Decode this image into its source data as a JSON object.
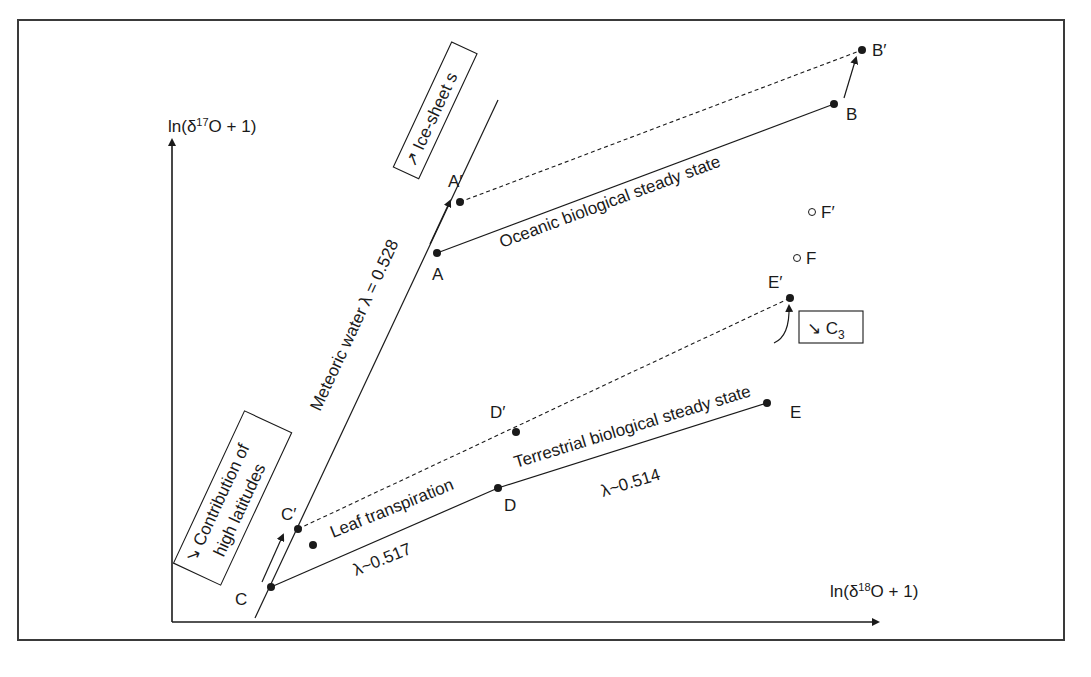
{
  "axes": {
    "y_label": "ln(δ17O + 1)",
    "y_label_parts": {
      "prefix": "ln(δ",
      "sup": "17",
      "suffix": "O + 1)"
    },
    "x_label": "ln(δ18O + 1)",
    "x_label_parts": {
      "prefix": "ln(δ",
      "sup": "18",
      "suffix": "O + 1)"
    }
  },
  "points": {
    "A": "A",
    "A_prime": "A′",
    "B": "B",
    "B_prime": "B′",
    "C": "C",
    "C_prime": "C′",
    "D": "D",
    "D_prime": "D′",
    "E": "E",
    "E_prime": "E′",
    "F": "F",
    "F_prime": "F′"
  },
  "lines": {
    "meteoric_water": "Meteoric water λ = 0.528",
    "oceanic": "Oceanic biological steady state",
    "leaf_transpiration": "Leaf transpiration",
    "leaf_lambda": "λ~0.517",
    "terrestrial": "Terrestrial biological steady state",
    "terrestrial_lambda": "λ~0.514"
  },
  "boxes": {
    "ice_sheets": "↗ Ice-sheet s",
    "high_latitudes_line1": "↘ Contribution of",
    "high_latitudes_line2": "high latitudes",
    "c3_arrow": "↘ C",
    "c3_sub": "3"
  },
  "colors": {
    "ink": "#1a1a1a",
    "frame": "#3a3a3a",
    "background": "#ffffff"
  }
}
